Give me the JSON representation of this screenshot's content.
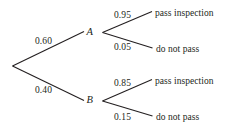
{
  "diagram": {
    "type": "probability-tree",
    "title": "",
    "background_color": "#ffffff",
    "line_color": "#231f20",
    "text_color": "#231f20",
    "root": {
      "label": ""
    },
    "branches": [
      {
        "probability": "0.60",
        "node_label": "A",
        "children": [
          {
            "probability": "0.95",
            "outcome": "pass inspection"
          },
          {
            "probability": "0.05",
            "outcome": "do not pass"
          }
        ]
      },
      {
        "probability": "0.40",
        "node_label": "B",
        "children": [
          {
            "probability": "0.85",
            "outcome": "pass inspection"
          },
          {
            "probability": "0.15",
            "outcome": "do not pass"
          }
        ]
      }
    ]
  }
}
